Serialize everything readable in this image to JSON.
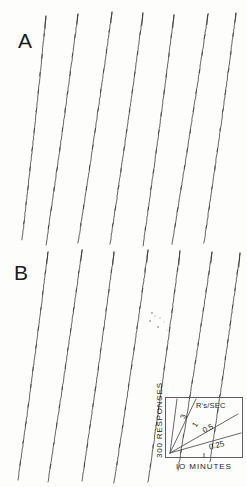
{
  "figure": {
    "background_color": "#fdfdfc",
    "ink_color": "#2b2b2b",
    "panels": [
      {
        "id": "A",
        "label": "A",
        "label_x": 18,
        "label_y": 30
      },
      {
        "id": "B",
        "label": "B",
        "label_x": 14,
        "label_y": 262
      }
    ]
  },
  "legend": {
    "rate_axis_label": "R's/SEC",
    "x_axis_label": "IO MINUTES",
    "y_axis_label": "300 RESPONSES",
    "rate_values": [
      "3",
      "1",
      "0.5",
      "0.25"
    ],
    "box": {
      "x": 165,
      "y": 397,
      "w": 78,
      "h": 61
    }
  },
  "chart_data": {
    "type": "line",
    "xlabel": "IO MINUTES",
    "ylabel": "300 RESPONSES",
    "grid": false,
    "legend_position": "bottom-right",
    "annotations": [
      "A",
      "B"
    ],
    "calibration": {
      "units": "R's/SEC",
      "time_per_division_minutes": 10,
      "responses_per_division": 300,
      "rate_lines": [
        {
          "label": "3",
          "responses_per_sec": 3
        },
        {
          "label": "1",
          "responses_per_sec": 1
        },
        {
          "label": "0.5",
          "responses_per_sec": 0.5
        },
        {
          "label": "0.25",
          "responses_per_sec": 0.25
        }
      ]
    },
    "series": [
      {
        "name": "A",
        "panel": "A",
        "description": "Seven resetting cumulative record segments, steep near-constant high response rate with small reinforcement pips",
        "segments": [
          {
            "x_start": 22,
            "x_end": 46,
            "y_start": 240,
            "y_end": 16,
            "slope_px_per_px": -9.3
          },
          {
            "x_start": 46,
            "x_end": 78,
            "y_start": 245,
            "y_end": 14,
            "slope_px_per_px": -7.2
          },
          {
            "x_start": 78,
            "x_end": 112,
            "y_start": 243,
            "y_end": 12,
            "slope_px_per_px": -6.8
          },
          {
            "x_start": 110,
            "x_end": 143,
            "y_start": 244,
            "y_end": 13,
            "slope_px_per_px": -7.0
          },
          {
            "x_start": 143,
            "x_end": 174,
            "y_start": 246,
            "y_end": 15,
            "slope_px_per_px": -7.5
          },
          {
            "x_start": 172,
            "x_end": 208,
            "y_start": 244,
            "y_end": 14,
            "slope_px_per_px": -6.4
          },
          {
            "x_start": 204,
            "x_end": 236,
            "y_start": 243,
            "y_end": 13,
            "slope_px_per_px": -7.2
          }
        ],
        "pip_count_per_segment": 11
      },
      {
        "name": "B",
        "panel": "B",
        "description": "Seven resetting cumulative record segments, slightly shallower sustained response rate with reinforcement pips",
        "segments": [
          {
            "x_start": 18,
            "x_end": 48,
            "y_start": 480,
            "y_end": 252,
            "slope_px_per_px": -7.6
          },
          {
            "x_start": 48,
            "x_end": 82,
            "y_start": 482,
            "y_end": 250,
            "slope_px_per_px": -6.8
          },
          {
            "x_start": 82,
            "x_end": 114,
            "y_start": 481,
            "y_end": 252,
            "slope_px_per_px": -7.2
          },
          {
            "x_start": 114,
            "x_end": 148,
            "y_start": 483,
            "y_end": 250,
            "slope_px_per_px": -6.9
          },
          {
            "x_start": 148,
            "x_end": 180,
            "y_start": 482,
            "y_end": 251,
            "slope_px_per_px": -7.2
          },
          {
            "x_start": 178,
            "x_end": 212,
            "y_start": 470,
            "y_end": 252,
            "slope_px_per_px": -6.4
          },
          {
            "x_start": 210,
            "x_end": 240,
            "y_start": 462,
            "y_end": 253,
            "slope_px_per_px": -7.0
          }
        ],
        "pip_count_per_segment": 11
      }
    ]
  }
}
